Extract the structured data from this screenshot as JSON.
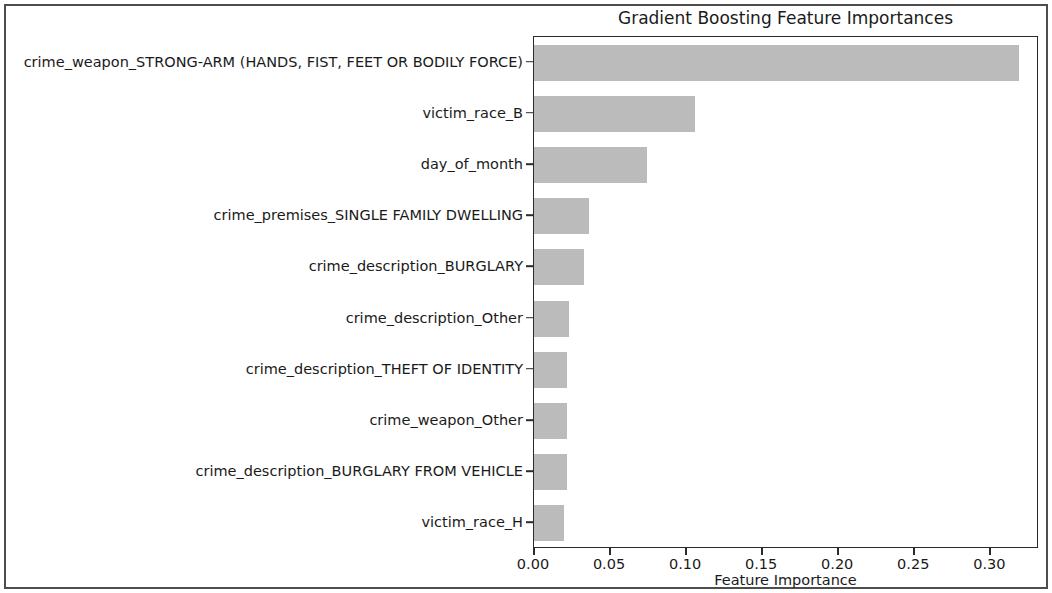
{
  "chart_data": {
    "type": "bar",
    "orientation": "horizontal",
    "title": "Gradient Boosting Feature Importances",
    "xlabel": "Feature Importance",
    "ylabel": "",
    "xlim": [
      0.0,
      0.332
    ],
    "xticks": [
      0.0,
      0.05,
      0.1,
      0.15,
      0.2,
      0.25,
      0.3
    ],
    "xtick_labels": [
      "0.00",
      "0.05",
      "0.10",
      "0.15",
      "0.20",
      "0.25",
      "0.30"
    ],
    "grid": false,
    "legend": null,
    "bar_color": "#bbbbbb",
    "categories": [
      "crime_weapon_STRONG-ARM (HANDS, FIST, FEET OR BODILY FORCE)",
      "victim_race_B",
      "day_of_month",
      "crime_premises_SINGLE FAMILY DWELLING",
      "crime_description_BURGLARY",
      "crime_description_Other",
      "crime_description_THEFT OF IDENTITY",
      "crime_weapon_Other",
      "crime_description_BURGLARY FROM VEHICLE",
      "victim_race_H"
    ],
    "values": [
      0.319,
      0.106,
      0.074,
      0.036,
      0.033,
      0.023,
      0.022,
      0.022,
      0.022,
      0.02
    ]
  }
}
